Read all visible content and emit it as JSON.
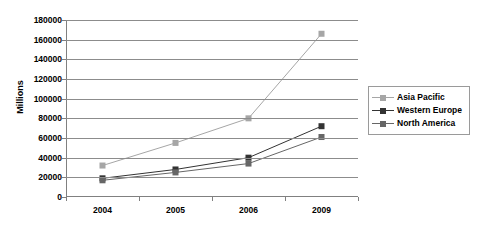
{
  "chart_data": {
    "type": "line",
    "title": "",
    "xlabel": "",
    "ylabel": "Millions",
    "categories": [
      "2004",
      "2005",
      "2006",
      "2009"
    ],
    "ylim": [
      0,
      180000
    ],
    "ytick_labels": [
      "0",
      "20000",
      "40000",
      "60000",
      "80000",
      "100000",
      "120000",
      "140000",
      "160000",
      "180000"
    ],
    "ytick_values": [
      0,
      20000,
      40000,
      60000,
      80000,
      100000,
      120000,
      140000,
      160000,
      180000
    ],
    "grid": true,
    "legend_position": "right",
    "series": [
      {
        "name": "Asia Pacific",
        "color": "#a6a6a6",
        "values": [
          32000,
          55000,
          80000,
          166000
        ]
      },
      {
        "name": "Western Europe",
        "color": "#333333",
        "values": [
          19000,
          28000,
          40000,
          72000
        ]
      },
      {
        "name": "North America",
        "color": "#666666",
        "values": [
          17000,
          25000,
          34000,
          61000
        ]
      }
    ]
  },
  "legend": {
    "entries": [
      {
        "label": "Asia Pacific"
      },
      {
        "label": "Western Europe"
      },
      {
        "label": "North America"
      }
    ]
  }
}
